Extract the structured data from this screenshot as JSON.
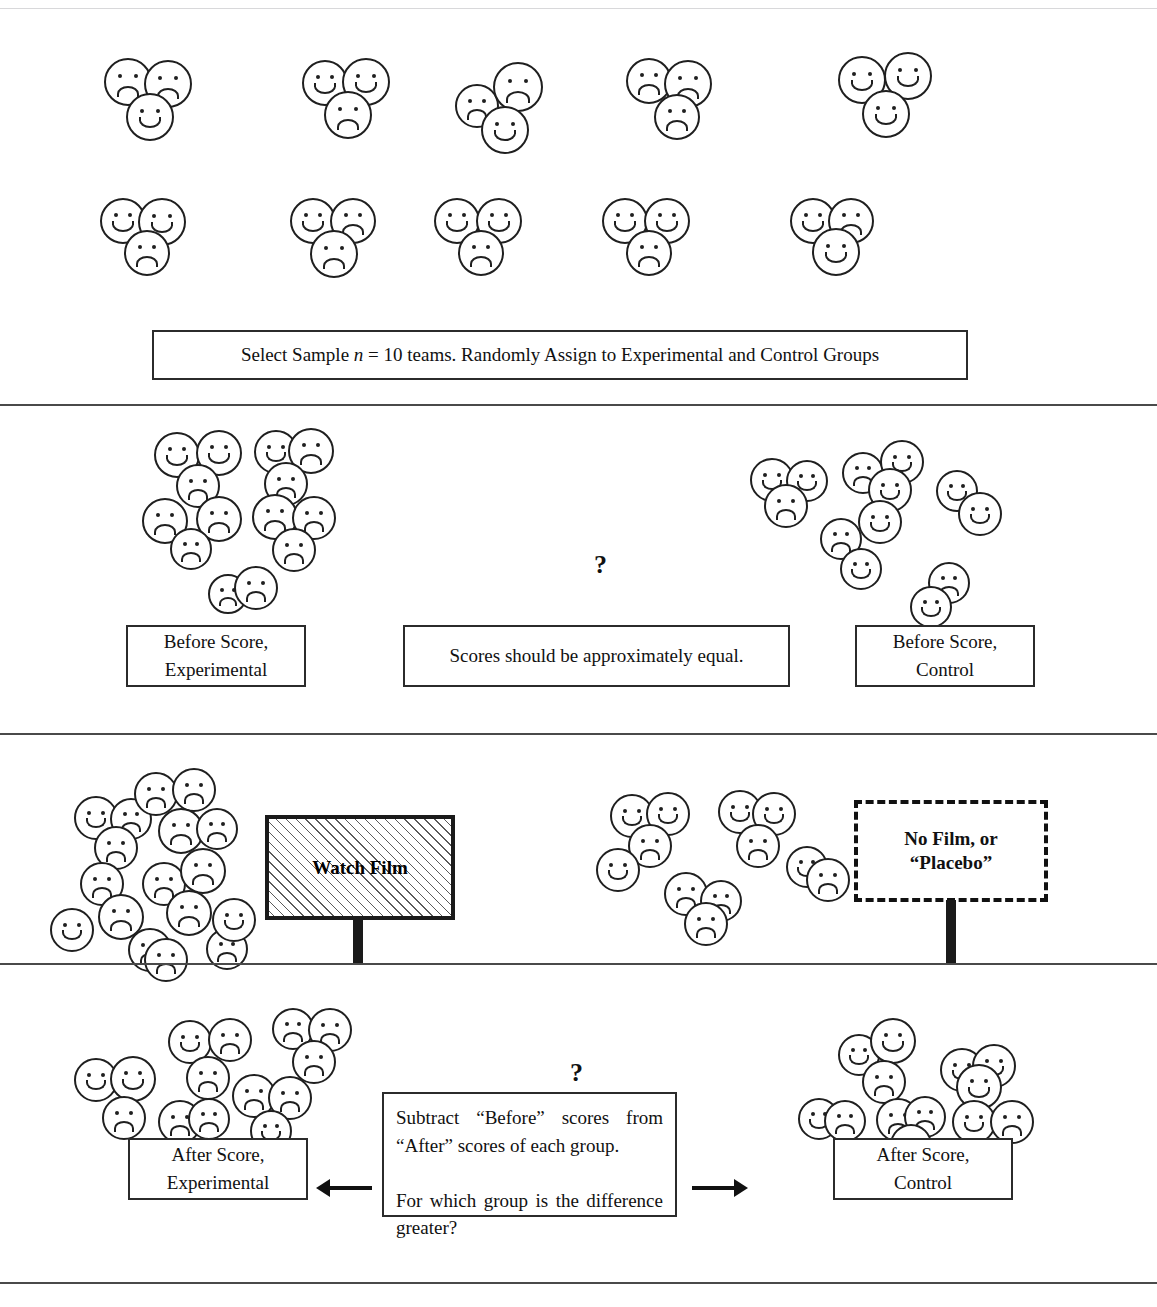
{
  "document": {
    "type": "experimental-design-flowchart",
    "title_hidden_top_rule": true
  },
  "sections": {
    "sample": {
      "caption": "Select Sample n = 10 teams. Randomly Assign to Experimental and Control Groups",
      "caption_parts": {
        "before": "Select Sample ",
        "italic_n": "n",
        "after": " = 10 teams. Randomly Assign to Experimental and Control Groups"
      },
      "teams_row_1": 5,
      "teams_row_2": 5,
      "total_teams": 10
    },
    "before": {
      "left_label": "Before Score,\nExperimental",
      "left_label_line1": "Before Score,",
      "left_label_line2": "Experimental",
      "center_label": "Scores should be approximately equal.",
      "center_question": "?",
      "right_label_line1": "Before Score,",
      "right_label_line2": "Control"
    },
    "treatment": {
      "experimental_sign_line1": "Watch Film",
      "control_sign_line1": "No Film, or",
      "control_sign_line2": "“Placebo”"
    },
    "after": {
      "question": "?",
      "center_text_line1": "Subtract “Before” scores from “After”",
      "center_text_line2": "scores of each group.",
      "center_text_line3": "For which group is the difference",
      "center_text_line4": "greater?",
      "left_label_line1": "After Score,",
      "left_label_line2": "Experimental",
      "right_label_line1": "After Score,",
      "right_label_line2": "Control",
      "left_arrow_icon": "arrow-left-icon",
      "right_arrow_icon": "arrow-right-icon"
    }
  },
  "colors": {
    "ink": "#1f1f1f",
    "rule": "#4a4a4a",
    "paper": "#ffffff"
  },
  "faces": {
    "teams_row1": [
      {
        "x": 104,
        "y": 58,
        "d": 48,
        "faces": [
          {
            "dx": 0,
            "dy": 0,
            "d": 48,
            "mood": "sad"
          },
          {
            "dx": 40,
            "dy": 2,
            "d": 48,
            "mood": "sad"
          },
          {
            "dx": 22,
            "dy": 35,
            "d": 48,
            "mood": "happy"
          }
        ]
      },
      {
        "x": 302,
        "y": 58,
        "d": 46,
        "faces": [
          {
            "dx": 0,
            "dy": 2,
            "d": 46,
            "mood": "happy"
          },
          {
            "dx": 40,
            "dy": 0,
            "d": 48,
            "mood": "happy"
          },
          {
            "dx": 22,
            "dy": 33,
            "d": 48,
            "mood": "sad"
          }
        ]
      },
      {
        "x": 455,
        "y": 62,
        "d": 42,
        "faces": [
          {
            "dx": 0,
            "dy": 22,
            "d": 44,
            "mood": "sad"
          },
          {
            "dx": 38,
            "dy": 0,
            "d": 50,
            "mood": "sad"
          },
          {
            "dx": 26,
            "dy": 44,
            "d": 48,
            "mood": "happy"
          }
        ]
      },
      {
        "x": 626,
        "y": 58,
        "d": 46,
        "faces": [
          {
            "dx": 0,
            "dy": 0,
            "d": 46,
            "mood": "sad"
          },
          {
            "dx": 38,
            "dy": 2,
            "d": 48,
            "mood": "sad"
          },
          {
            "dx": 28,
            "dy": 36,
            "d": 46,
            "mood": "sad"
          }
        ]
      },
      {
        "x": 838,
        "y": 52,
        "d": 46,
        "faces": [
          {
            "dx": 0,
            "dy": 4,
            "d": 48,
            "mood": "happy"
          },
          {
            "dx": 46,
            "dy": 0,
            "d": 48,
            "mood": "happy"
          },
          {
            "dx": 24,
            "dy": 38,
            "d": 48,
            "mood": "happy"
          }
        ]
      }
    ],
    "teams_row2": [
      {
        "x": 100,
        "y": 198,
        "d": 44,
        "faces": [
          {
            "dx": 0,
            "dy": 0,
            "d": 46,
            "mood": "happy"
          },
          {
            "dx": 38,
            "dy": 0,
            "d": 48,
            "mood": "happy"
          },
          {
            "dx": 24,
            "dy": 32,
            "d": 46,
            "mood": "sad"
          }
        ]
      },
      {
        "x": 290,
        "y": 198,
        "d": 44,
        "faces": [
          {
            "dx": 0,
            "dy": 0,
            "d": 46,
            "mood": "happy"
          },
          {
            "dx": 40,
            "dy": 0,
            "d": 46,
            "mood": "sad"
          },
          {
            "dx": 20,
            "dy": 32,
            "d": 48,
            "mood": "sad"
          }
        ]
      },
      {
        "x": 434,
        "y": 198,
        "d": 44,
        "faces": [
          {
            "dx": 0,
            "dy": 0,
            "d": 46,
            "mood": "happy"
          },
          {
            "dx": 42,
            "dy": 0,
            "d": 46,
            "mood": "happy"
          },
          {
            "dx": 24,
            "dy": 32,
            "d": 46,
            "mood": "sad"
          }
        ]
      },
      {
        "x": 602,
        "y": 198,
        "d": 44,
        "faces": [
          {
            "dx": 0,
            "dy": 0,
            "d": 46,
            "mood": "happy"
          },
          {
            "dx": 42,
            "dy": 0,
            "d": 46,
            "mood": "happy"
          },
          {
            "dx": 24,
            "dy": 32,
            "d": 46,
            "mood": "sad"
          }
        ]
      },
      {
        "x": 790,
        "y": 198,
        "d": 44,
        "faces": [
          {
            "dx": 0,
            "dy": 0,
            "d": 46,
            "mood": "happy"
          },
          {
            "dx": 38,
            "dy": 0,
            "d": 46,
            "mood": "sad"
          },
          {
            "dx": 22,
            "dy": 30,
            "d": 48,
            "mood": "happy"
          }
        ]
      }
    ],
    "before_experimental": [
      {
        "x": 154,
        "y": 432,
        "d": 46,
        "mood": "happy"
      },
      {
        "x": 196,
        "y": 430,
        "d": 46,
        "mood": "happy"
      },
      {
        "x": 176,
        "y": 464,
        "d": 44,
        "mood": "sad"
      },
      {
        "x": 254,
        "y": 430,
        "d": 44,
        "mood": "happy"
      },
      {
        "x": 288,
        "y": 428,
        "d": 46,
        "mood": "sad"
      },
      {
        "x": 264,
        "y": 462,
        "d": 44,
        "mood": "sad"
      },
      {
        "x": 142,
        "y": 498,
        "d": 46,
        "mood": "sad"
      },
      {
        "x": 196,
        "y": 496,
        "d": 46,
        "mood": "sad"
      },
      {
        "x": 170,
        "y": 528,
        "d": 42,
        "mood": "sad"
      },
      {
        "x": 252,
        "y": 494,
        "d": 46,
        "mood": "sad"
      },
      {
        "x": 292,
        "y": 496,
        "d": 44,
        "mood": "sad"
      },
      {
        "x": 272,
        "y": 528,
        "d": 44,
        "mood": "sad"
      },
      {
        "x": 208,
        "y": 574,
        "d": 40,
        "mood": "sad"
      },
      {
        "x": 234,
        "y": 566,
        "d": 44,
        "mood": "sad"
      }
    ],
    "before_control": [
      {
        "x": 750,
        "y": 458,
        "d": 44,
        "mood": "happy"
      },
      {
        "x": 786,
        "y": 460,
        "d": 42,
        "mood": "happy"
      },
      {
        "x": 764,
        "y": 484,
        "d": 44,
        "mood": "sad"
      },
      {
        "x": 842,
        "y": 452,
        "d": 42,
        "mood": "sad"
      },
      {
        "x": 880,
        "y": 440,
        "d": 44,
        "mood": "happy"
      },
      {
        "x": 868,
        "y": 468,
        "d": 44,
        "mood": "happy"
      },
      {
        "x": 858,
        "y": 500,
        "d": 44,
        "mood": "happy"
      },
      {
        "x": 820,
        "y": 518,
        "d": 42,
        "mood": "sad"
      },
      {
        "x": 840,
        "y": 548,
        "d": 42,
        "mood": "happy"
      },
      {
        "x": 936,
        "y": 470,
        "d": 42,
        "mood": "happy"
      },
      {
        "x": 958,
        "y": 492,
        "d": 44,
        "mood": "happy"
      },
      {
        "x": 928,
        "y": 562,
        "d": 42,
        "mood": "sad"
      },
      {
        "x": 910,
        "y": 586,
        "d": 42,
        "mood": "happy"
      }
    ],
    "after_film_experimental": [
      {
        "x": 74,
        "y": 796,
        "d": 44,
        "mood": "happy"
      },
      {
        "x": 110,
        "y": 798,
        "d": 42,
        "mood": "sad"
      },
      {
        "x": 94,
        "y": 826,
        "d": 44,
        "mood": "sad"
      },
      {
        "x": 134,
        "y": 772,
        "d": 44,
        "mood": "sad"
      },
      {
        "x": 172,
        "y": 768,
        "d": 44,
        "mood": "sad"
      },
      {
        "x": 158,
        "y": 808,
        "d": 46,
        "mood": "sad"
      },
      {
        "x": 196,
        "y": 808,
        "d": 42,
        "mood": "sad"
      },
      {
        "x": 80,
        "y": 862,
        "d": 44,
        "mood": "sad"
      },
      {
        "x": 98,
        "y": 894,
        "d": 46,
        "mood": "sad"
      },
      {
        "x": 50,
        "y": 908,
        "d": 44,
        "mood": "happy"
      },
      {
        "x": 142,
        "y": 862,
        "d": 44,
        "mood": "sad"
      },
      {
        "x": 180,
        "y": 848,
        "d": 46,
        "mood": "sad"
      },
      {
        "x": 166,
        "y": 890,
        "d": 46,
        "mood": "sad"
      },
      {
        "x": 128,
        "y": 928,
        "d": 44,
        "mood": "sad"
      },
      {
        "x": 144,
        "y": 938,
        "d": 44,
        "mood": "sad"
      },
      {
        "x": 206,
        "y": 928,
        "d": 42,
        "mood": "sad"
      },
      {
        "x": 212,
        "y": 898,
        "d": 44,
        "mood": "happy"
      }
    ],
    "after_film_control": [
      {
        "x": 610,
        "y": 794,
        "d": 44,
        "mood": "happy"
      },
      {
        "x": 646,
        "y": 792,
        "d": 44,
        "mood": "happy"
      },
      {
        "x": 628,
        "y": 824,
        "d": 44,
        "mood": "sad"
      },
      {
        "x": 596,
        "y": 848,
        "d": 44,
        "mood": "happy"
      },
      {
        "x": 718,
        "y": 790,
        "d": 44,
        "mood": "happy"
      },
      {
        "x": 752,
        "y": 792,
        "d": 44,
        "mood": "happy"
      },
      {
        "x": 736,
        "y": 824,
        "d": 44,
        "mood": "sad"
      },
      {
        "x": 786,
        "y": 846,
        "d": 42,
        "mood": "happy"
      },
      {
        "x": 806,
        "y": 858,
        "d": 44,
        "mood": "sad"
      },
      {
        "x": 664,
        "y": 872,
        "d": 44,
        "mood": "sad"
      },
      {
        "x": 700,
        "y": 880,
        "d": 42,
        "mood": "sad"
      },
      {
        "x": 684,
        "y": 902,
        "d": 44,
        "mood": "sad"
      }
    ],
    "after_experimental": [
      {
        "x": 74,
        "y": 1058,
        "d": 44,
        "mood": "happy"
      },
      {
        "x": 110,
        "y": 1056,
        "d": 46,
        "mood": "happy"
      },
      {
        "x": 102,
        "y": 1096,
        "d": 44,
        "mood": "sad"
      },
      {
        "x": 168,
        "y": 1020,
        "d": 44,
        "mood": "happy"
      },
      {
        "x": 208,
        "y": 1018,
        "d": 44,
        "mood": "sad"
      },
      {
        "x": 186,
        "y": 1056,
        "d": 44,
        "mood": "sad"
      },
      {
        "x": 158,
        "y": 1100,
        "d": 44,
        "mood": "sad"
      },
      {
        "x": 188,
        "y": 1098,
        "d": 42,
        "mood": "sad"
      },
      {
        "x": 272,
        "y": 1008,
        "d": 42,
        "mood": "sad"
      },
      {
        "x": 308,
        "y": 1008,
        "d": 44,
        "mood": "sad"
      },
      {
        "x": 292,
        "y": 1040,
        "d": 44,
        "mood": "sad"
      },
      {
        "x": 232,
        "y": 1074,
        "d": 44,
        "mood": "sad"
      },
      {
        "x": 268,
        "y": 1076,
        "d": 44,
        "mood": "sad"
      },
      {
        "x": 250,
        "y": 1110,
        "d": 42,
        "mood": "happy"
      }
    ],
    "after_control": [
      {
        "x": 838,
        "y": 1034,
        "d": 42,
        "mood": "happy"
      },
      {
        "x": 870,
        "y": 1018,
        "d": 46,
        "mood": "happy"
      },
      {
        "x": 862,
        "y": 1060,
        "d": 44,
        "mood": "sad"
      },
      {
        "x": 798,
        "y": 1098,
        "d": 42,
        "mood": "happy"
      },
      {
        "x": 824,
        "y": 1100,
        "d": 42,
        "mood": "sad"
      },
      {
        "x": 876,
        "y": 1098,
        "d": 44,
        "mood": "sad"
      },
      {
        "x": 904,
        "y": 1096,
        "d": 42,
        "mood": "sad"
      },
      {
        "x": 890,
        "y": 1124,
        "d": 42,
        "mood": "sad"
      },
      {
        "x": 940,
        "y": 1048,
        "d": 44,
        "mood": "happy"
      },
      {
        "x": 972,
        "y": 1044,
        "d": 44,
        "mood": "happy"
      },
      {
        "x": 956,
        "y": 1064,
        "d": 46,
        "mood": "happy"
      },
      {
        "x": 952,
        "y": 1100,
        "d": 44,
        "mood": "happy"
      },
      {
        "x": 990,
        "y": 1100,
        "d": 44,
        "mood": "sad"
      }
    ]
  }
}
